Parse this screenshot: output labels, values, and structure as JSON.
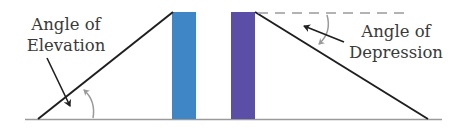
{
  "diagram": {
    "labels": {
      "elevation": {
        "line1": "Angle of",
        "line2": "Elevation"
      },
      "depression": {
        "line1": "Angle of",
        "line2": "Depression"
      }
    },
    "colors": {
      "left_tower": "#3f86c7",
      "right_tower": "#5a4ea6",
      "ground": "#9a9a9a",
      "line_of_sight": "#1f1f1f",
      "horizontal_dashed": "#9a9a9a",
      "angle_arc": "#9a9a9a",
      "pointer_arrow": "#1f1f1f",
      "text": "#3a3a3a"
    },
    "elements": [
      "ground-line",
      "left-line-of-sight",
      "left-tower",
      "right-tower",
      "right-line-of-sight",
      "horizontal-dashed-line",
      "elevation-angle-arc",
      "depression-angle-arc",
      "elevation-pointer-arrow",
      "depression-pointer-arrow"
    ]
  }
}
